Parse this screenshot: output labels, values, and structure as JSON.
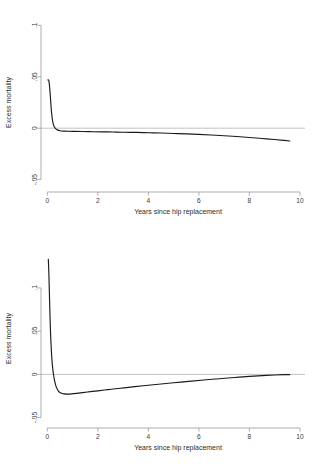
{
  "figure": {
    "background": "#ffffff",
    "curve_color": "#1a1a1a",
    "axis_color": "#9a9a9a",
    "reference_line_color": "#b4b4b4"
  },
  "chart_data": [
    {
      "type": "line",
      "panel": "top",
      "title": "",
      "xlabel": "Years since hip replacement",
      "ylabel": "Excess mortality",
      "xlim": [
        -0.25,
        10.2
      ],
      "ylim": [
        -0.062,
        0.112
      ],
      "xticks": [
        0,
        2,
        4,
        6,
        8,
        10
      ],
      "xticklabels": [
        "0",
        "2",
        "4",
        "6",
        "8",
        "10"
      ],
      "yticks": [
        0.1,
        0.05,
        0,
        -0.05
      ],
      "yticklabels": [
        ".1",
        ".05",
        "0",
        "-.05"
      ],
      "grid": false,
      "legend": null,
      "reference_lines": [
        {
          "axis": "y",
          "value": 0
        }
      ],
      "series": [
        {
          "name": "Excess mortality",
          "x": [
            0.02,
            0.05,
            0.08,
            0.11,
            0.14,
            0.17,
            0.2,
            0.24,
            0.28,
            0.33,
            0.4,
            0.5,
            0.65,
            0.85,
            1.1,
            1.4,
            1.8,
            2.2,
            2.6,
            3.0,
            3.5,
            4.0,
            4.5,
            5.0,
            5.5,
            6.0,
            6.5,
            7.0,
            7.5,
            8.0,
            8.5,
            9.0,
            9.35,
            9.6
          ],
          "y": [
            0.047,
            0.0468,
            0.043,
            0.0345,
            0.024,
            0.0148,
            0.0085,
            0.0038,
            0.0012,
            -0.0004,
            -0.0016,
            -0.0024,
            -0.0028,
            -0.003,
            -0.0031,
            -0.0032,
            -0.0034,
            -0.0035,
            -0.0037,
            -0.0039,
            -0.0041,
            -0.0044,
            -0.0047,
            -0.0051,
            -0.0055,
            -0.006,
            -0.0066,
            -0.0073,
            -0.0081,
            -0.009,
            -0.01,
            -0.011,
            -0.0118,
            -0.0124
          ]
        }
      ]
    },
    {
      "type": "line",
      "panel": "bottom",
      "title": "",
      "xlabel": "Years since hip replacement",
      "ylabel": "Excess mortality",
      "xlim": [
        -0.25,
        10.2
      ],
      "ylim": [
        -0.062,
        0.145
      ],
      "xticks": [
        0,
        2,
        4,
        6,
        8,
        10
      ],
      "xticklabels": [
        "0",
        "2",
        "4",
        "6",
        "8",
        "10"
      ],
      "yticks": [
        0.1,
        0.05,
        0,
        -0.05
      ],
      "yticklabels": [
        ".1",
        ".05",
        "0",
        "-.05"
      ],
      "grid": false,
      "legend": null,
      "reference_lines": [
        {
          "axis": "y",
          "value": 0
        }
      ],
      "series": [
        {
          "name": "Excess mortality",
          "x": [
            0.04,
            0.06,
            0.08,
            0.1,
            0.12,
            0.15,
            0.18,
            0.21,
            0.25,
            0.3,
            0.36,
            0.44,
            0.54,
            0.66,
            0.8,
            0.95,
            1.15,
            1.4,
            1.7,
            2.0,
            2.4,
            2.8,
            3.3,
            3.8,
            4.4,
            5.0,
            5.6,
            6.2,
            6.8,
            7.4,
            8.0,
            8.5,
            9.0,
            9.35,
            9.6
          ],
          "y": [
            0.133,
            0.118,
            0.096,
            0.074,
            0.0545,
            0.033,
            0.018,
            0.0078,
            -0.001,
            -0.009,
            -0.015,
            -0.0193,
            -0.0216,
            -0.0226,
            -0.0228,
            -0.0226,
            -0.022,
            -0.0211,
            -0.02,
            -0.019,
            -0.0176,
            -0.0163,
            -0.0147,
            -0.0132,
            -0.0114,
            -0.0097,
            -0.0081,
            -0.0065,
            -0.005,
            -0.0036,
            -0.0023,
            -0.0014,
            -0.0007,
            -0.0003,
            -0.0002
          ]
        }
      ]
    }
  ]
}
